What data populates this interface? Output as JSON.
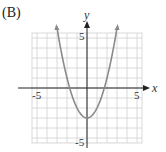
{
  "option_label": "(B)",
  "chart_data": {
    "type": "line",
    "title": "",
    "function": "y = x^2 - 3",
    "xlabel": "x",
    "ylabel": "y",
    "xlim": [
      -5.5,
      5.5
    ],
    "ylim": [
      -5.5,
      5.5
    ],
    "grid": true,
    "x_tick_labels": [
      "-5",
      "5"
    ],
    "y_tick_labels": [
      "5",
      "-5"
    ],
    "series": [
      {
        "name": "parabola",
        "x": [
          -3,
          -2.5,
          -2,
          -1.5,
          -1,
          -0.5,
          0,
          0.5,
          1,
          1.5,
          2,
          2.5,
          3
        ],
        "y": [
          6,
          3.25,
          1,
          -0.75,
          -2,
          -2.75,
          -3,
          -2.75,
          -2,
          -0.75,
          1,
          3.25,
          6
        ],
        "color": "#8a8a8a"
      }
    ],
    "vertex": [
      0,
      -3
    ],
    "endpoints": [
      [
        -3,
        6
      ],
      [
        3,
        6
      ]
    ],
    "legend": null
  },
  "colors": {
    "grid": "#d0d0d0",
    "axis": "#222222",
    "curve": "#8a8a8a"
  }
}
